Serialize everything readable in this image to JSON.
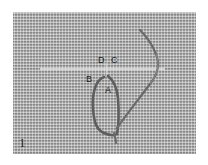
{
  "photo": {
    "subject": "embroidery stitch on aida cloth",
    "fabric_color": "#9c9c9c",
    "thread_color": "#5e5e5e",
    "guide_thread_color": "#e6e6e6"
  },
  "labels": {
    "D": "D",
    "C": "C",
    "B": "B",
    "A": "A"
  },
  "step_number": "1"
}
